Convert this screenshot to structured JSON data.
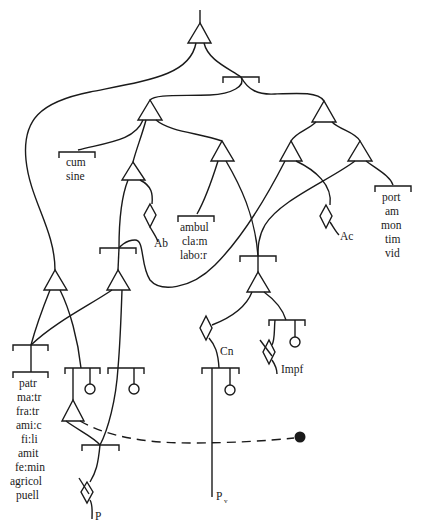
{
  "diagram": {
    "type": "network / parsing diagram",
    "labels": {
      "cum_sine": [
        "cum",
        "sine"
      ],
      "ab": "Ab",
      "ambul_group": [
        "ambul",
        "cla:m",
        "labo:r"
      ],
      "ac": "Ac",
      "port_group": [
        "port",
        "am",
        "mon",
        "tim",
        "vid"
      ],
      "cn": "Cn",
      "impf": "Impf",
      "patr_group": [
        "patr",
        "ma:tr",
        "fra:tr",
        "ami:c",
        "fi:li",
        "amit",
        "fe:min",
        "agricol",
        "puell"
      ],
      "p": "P",
      "pv": "P",
      "pv_subscript": "v"
    },
    "caption": "Figure (caption partially cut off)"
  }
}
